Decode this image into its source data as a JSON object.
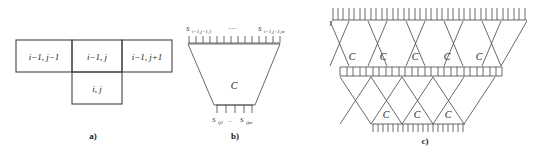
{
  "figure": {
    "kind": "diagram",
    "background": "#ffffff",
    "stroke_color": "#444444",
    "text_color": "#1a1a1a",
    "panels": [
      {
        "id": "a",
        "label": "a)",
        "description": "grid neighbourhood cells",
        "cells": [
          {
            "name": "cell-top-left",
            "text": "i−1, j−1"
          },
          {
            "name": "cell-top-middle",
            "text": "i−1, j"
          },
          {
            "name": "cell-top-right",
            "text": "i−1, j+1"
          },
          {
            "name": "cell-bottom",
            "text": "i, j"
          }
        ]
      },
      {
        "id": "b",
        "label": "b)",
        "description": "single trapezoidal cell block C with input and output buses",
        "block_label": "C",
        "input_label_left": "S",
        "input_sub_left": "i−1,j−1,1",
        "input_ellipsis": "···",
        "input_label_right": "S",
        "input_sub_right": "i−1,j+1,m",
        "output_label_left": "S",
        "output_sub_left": "ij1",
        "output_ellipsis": "...",
        "output_label_right": "S",
        "output_sub_right": "ijm",
        "input_ticks": 13,
        "output_ticks": 4
      },
      {
        "id": "c",
        "label": "c)",
        "description": "two-layer cascaded array of C blocks",
        "block_label": "C",
        "top_row_blocks": 5,
        "bottom_row_blocks": 3,
        "top_ticks": 36,
        "middle_boxes": 25,
        "bottom_ticks": 22
      }
    ]
  }
}
